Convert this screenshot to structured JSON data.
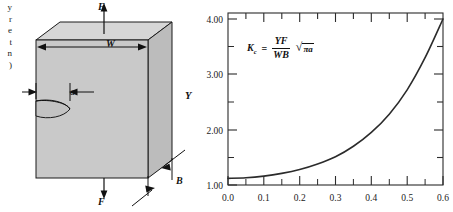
{
  "figure": {
    "margin_text": "y\nr\ne\nt\nn\n)"
  },
  "specimen": {
    "force_top_label": "F",
    "force_bottom_label": "F",
    "width_label": "W",
    "crack_label": "a",
    "thickness_label": "B",
    "face_color": "#c9c9c9",
    "top_color": "#d8d8d8",
    "side_color": "#bdbdbd",
    "line_color": "#1a1a1a"
  },
  "formula": {
    "lhs": "K",
    "lhs_sub": "c",
    "equals": "=",
    "numerator": "YF",
    "denominator": "WB",
    "radical_sign": "√",
    "radicand": "πa",
    "plain": "K_c = (YF/WB) √(πa)"
  },
  "chart_data": {
    "type": "line",
    "title": "",
    "xlabel": "",
    "ylabel": "Y",
    "xlim": [
      0.0,
      0.6
    ],
    "ylim": [
      1.0,
      4.2
    ],
    "grid": false,
    "legend": "none",
    "annotations": [
      "K_c = (YF/WB) √(πa)"
    ],
    "x_ticks": [
      0.0,
      0.1,
      0.2,
      0.3,
      0.4,
      0.5,
      0.6
    ],
    "x_tick_labels": [
      "0.0",
      "0.1",
      "0.2",
      "0.3",
      "0.4",
      "0.5",
      "0.6"
    ],
    "x_minor_ticks": [
      0.05,
      0.15,
      0.25,
      0.35,
      0.45,
      0.55
    ],
    "y_ticks": [
      1.0,
      2.0,
      3.0,
      4.0
    ],
    "y_tick_labels": [
      "1.00",
      "2.00",
      "3.00",
      "4.00"
    ],
    "y_minor_ticks": [
      1.5,
      2.5,
      3.5
    ],
    "series": [
      {
        "name": "Y vs a/W",
        "color": "#2b2b2b",
        "x": [
          0.0,
          0.05,
          0.1,
          0.15,
          0.2,
          0.25,
          0.3,
          0.35,
          0.4,
          0.45,
          0.5,
          0.55,
          0.6
        ],
        "values": [
          1.12,
          1.13,
          1.16,
          1.21,
          1.28,
          1.38,
          1.51,
          1.7,
          1.95,
          2.28,
          2.72,
          3.3,
          4.0
        ]
      }
    ]
  }
}
